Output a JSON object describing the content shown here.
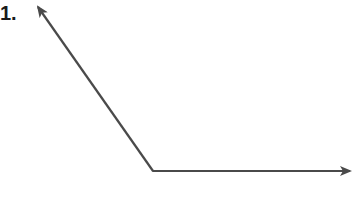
{
  "problem": {
    "number_label": "1."
  },
  "figure": {
    "type": "angle",
    "vertex": [
      153,
      171
    ],
    "rays": [
      {
        "name": "upper-left-ray",
        "end": [
          36,
          4
        ]
      },
      {
        "name": "right-ray",
        "end": [
          353,
          171
        ]
      }
    ],
    "stroke_color": "#4a4a4a"
  }
}
